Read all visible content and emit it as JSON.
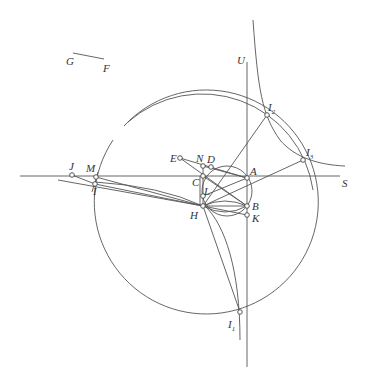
{
  "diagram": {
    "type": "geometric-construction",
    "labels": {
      "A": "A",
      "B": "B",
      "C": "C",
      "D": "D",
      "E": "E",
      "F": "F",
      "G": "G",
      "H": "H",
      "I": "I",
      "J": "J",
      "K": "K",
      "L": "L",
      "M": "M",
      "N": "N",
      "S": "S",
      "U": "U",
      "I1_base": "I",
      "I1_sub": "1",
      "I2_base": "I",
      "I2_sub": "2",
      "I3_base": "I",
      "I3_sub": "3"
    },
    "points": {
      "A": [
        247,
        178
      ],
      "B": [
        247,
        206
      ],
      "C": [
        203,
        176
      ],
      "D": [
        211,
        167
      ],
      "E": [
        180,
        158
      ],
      "H": [
        203,
        206
      ],
      "I": [
        95,
        184
      ],
      "J": [
        72,
        175
      ],
      "K": [
        247,
        215
      ],
      "L": [
        203,
        196
      ],
      "M": [
        96,
        177
      ],
      "N": [
        203,
        166
      ],
      "I1": [
        240,
        312
      ],
      "I2": [
        267,
        115
      ],
      "I3": [
        303,
        160
      ]
    },
    "segments": {
      "GF": [
        [
          73,
          53
        ],
        [
          104,
          59
        ]
      ]
    },
    "circles": {
      "main": {
        "cx": 203,
        "cy": 206,
        "r": 112
      },
      "small": {
        "cx": 227,
        "cy": 191,
        "r": 25
      }
    }
  }
}
